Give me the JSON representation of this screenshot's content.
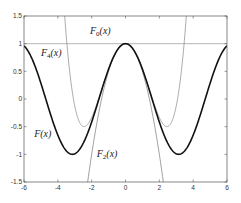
{
  "chart_data": {
    "type": "line",
    "title": "",
    "xlabel": "",
    "ylabel": "",
    "xlim": [
      -6,
      6
    ],
    "ylim": [
      -1.5,
      1.5
    ],
    "grid": false,
    "legend": null,
    "x_ticks": [
      -6,
      -4,
      -2,
      0,
      2,
      4,
      6
    ],
    "y_ticks": [
      -1.5,
      -1,
      -0.5,
      0,
      0.5,
      1,
      1.5
    ],
    "x_tick_labels": [
      "-6",
      "-4",
      "-2",
      "0",
      "2",
      "4",
      "6"
    ],
    "y_tick_labels": [
      "-1.5",
      "-1",
      "-0.5",
      "0",
      "0.5",
      "1",
      "1.5"
    ],
    "series": [
      {
        "name": "F(x)",
        "function": "cos(x)",
        "color": "#111111",
        "width": 1.6,
        "sample_points": {
          "x": [
            -6,
            -3.14,
            0,
            3.14,
            6
          ],
          "y": [
            0.96,
            -1,
            1,
            -1,
            0.96
          ]
        }
      },
      {
        "name": "F0(x)",
        "function": "1",
        "color": "#888888",
        "width": 0.7,
        "sample_points": {
          "x": [
            -6,
            6
          ],
          "y": [
            1,
            1
          ]
        }
      },
      {
        "name": "F2(x)",
        "function": "1 - x^2/2",
        "color": "#777777",
        "width": 0.7,
        "sample_points": {
          "x": [
            -2.24,
            0,
            2.24
          ],
          "y": [
            -1.5,
            1,
            -1.5
          ]
        }
      },
      {
        "name": "F4(x)",
        "function": "1 - x^2/2 + x^4/24",
        "color": "#888888",
        "width": 0.7,
        "sample_points": {
          "x": [
            -3.6,
            -2.45,
            0,
            2.45,
            3.6
          ],
          "y": [
            1.5,
            -0.5,
            1,
            -0.5,
            1.5
          ]
        }
      }
    ],
    "annotations": [
      {
        "text": "F0(x)",
        "main": "F",
        "sub": "0",
        "tail": "(x)",
        "x": -2.1,
        "y": 1.18
      },
      {
        "text": "F4(x)",
        "main": "F",
        "sub": "4",
        "tail": "(x)",
        "x": -5.0,
        "y": 0.78
      },
      {
        "text": "F(x)",
        "main": "F",
        "sub": "",
        "tail": "(x)",
        "x": -5.4,
        "y": -0.68
      },
      {
        "text": "F2(x)",
        "main": "F",
        "sub": "2",
        "tail": "(x)",
        "x": -1.7,
        "y": -1.05
      }
    ]
  }
}
